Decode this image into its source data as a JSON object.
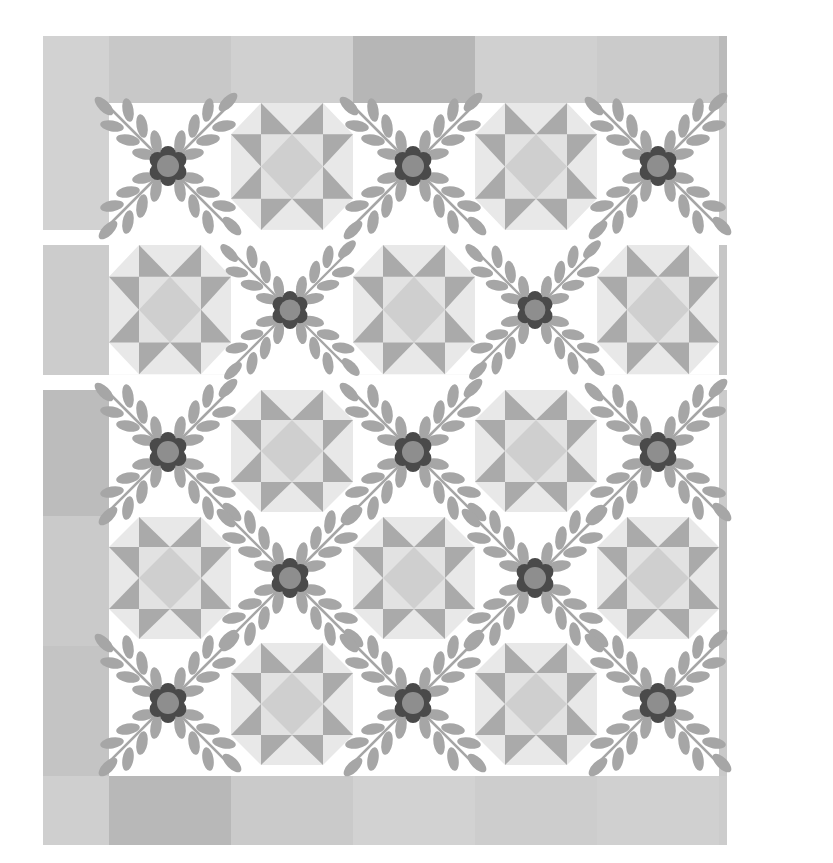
{
  "caption": {
    "text": "Quilt assembly diagram (cut off at top of page)"
  },
  "quilt": {
    "description": "Quilt layout diagram with alternating flower-and-leaf appliqué blocks and Ohio Star pieced blocks, framed by a patchwork border",
    "colors": {
      "border_light": "#d0d0d0",
      "border_mid": "#c4c4c4",
      "border_dark": "#b4b4b4",
      "background": "#ffffff",
      "star_point": "#aaaaaa",
      "star_center": "#cfcfcf",
      "star_light": "#e6e6e6",
      "leaf": "#a6a6a6",
      "flower_petal": "#4a4a4a",
      "flower_center": "#8e8e8e"
    },
    "sections": [
      {
        "name": "top-row",
        "blocks": [
          "flower",
          "star",
          "flower",
          "star",
          "flower"
        ]
      },
      {
        "name": "middle-row",
        "blocks": [
          "star",
          "flower",
          "star",
          "flower",
          "star"
        ]
      },
      {
        "name": "bottom-row-1",
        "blocks": [
          "flower",
          "star",
          "flower",
          "star",
          "flower"
        ]
      },
      {
        "name": "bottom-row-2",
        "blocks": [
          "star",
          "flower",
          "star",
          "flower",
          "star"
        ]
      },
      {
        "name": "bottom-row-3",
        "blocks": [
          "flower",
          "star",
          "flower",
          "star",
          "flower"
        ]
      }
    ]
  }
}
